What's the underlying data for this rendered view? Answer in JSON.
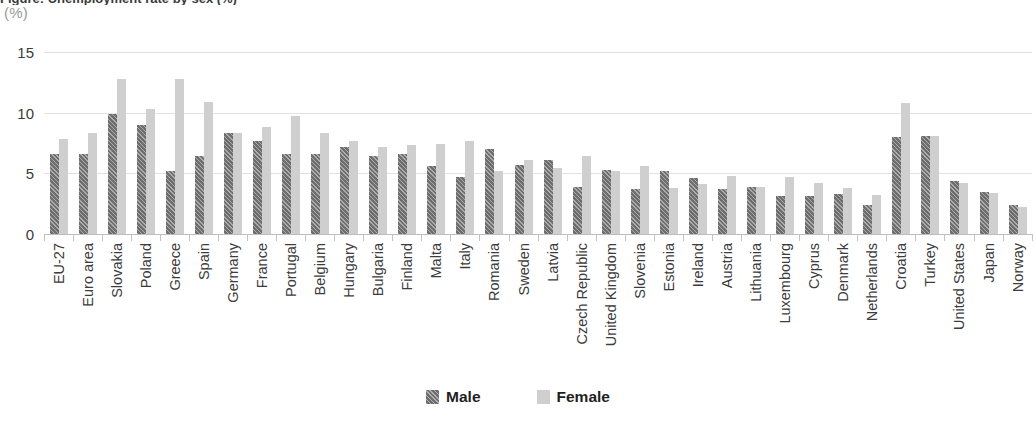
{
  "title": "Figure: Unemployment rate by sex (%)",
  "unit_label": "(%)",
  "legend": {
    "position": "bottom-center",
    "items": [
      {
        "label": "Male",
        "color": "#6e6e6e",
        "pattern": "diagonal-hatch"
      },
      {
        "label": "Female",
        "color": "#cfcfcf",
        "pattern": "solid"
      }
    ]
  },
  "yaxis": {
    "ticks": [
      "0",
      "5",
      "10",
      "15"
    ],
    "values": [
      0,
      5,
      10,
      15
    ],
    "min": 0,
    "max": 15
  },
  "chart_data": {
    "type": "bar",
    "title": "Figure: Unemployment rate by sex (%)",
    "xlabel": "",
    "ylabel": "(%)",
    "ylim": [
      0,
      15
    ],
    "yticks": [
      0,
      5,
      10,
      15
    ],
    "grid": "horizontal",
    "legend_position": "bottom-center",
    "categories": [
      "EU-27",
      "Euro area",
      "Slovakia",
      "Poland",
      "Greece",
      "Spain",
      "Germany",
      "France",
      "Portugal",
      "Belgium",
      "Hungary",
      "Bulgaria",
      "Finland",
      "Malta",
      "Italy",
      "Romania",
      "Sweden",
      "Latvia",
      "Czech Republic",
      "United Kingdom",
      "Slovenia",
      "Estonia",
      "Ireland",
      "Austria",
      "Lithuania",
      "Luxembourg",
      "Cyprus",
      "Denmark",
      "Netherlands",
      "Croatia",
      "Turkey",
      "United States",
      "Japan",
      "Norway"
    ],
    "series": [
      {
        "name": "Male",
        "color": "#6e6e6e",
        "values": [
          6.6,
          6.6,
          9.9,
          9.0,
          5.2,
          6.4,
          8.3,
          7.7,
          6.6,
          6.6,
          7.2,
          6.4,
          6.6,
          5.6,
          4.7,
          7.0,
          5.7,
          6.1,
          3.9,
          5.3,
          3.7,
          5.2,
          4.6,
          3.7,
          3.9,
          3.1,
          3.1,
          3.3,
          2.4,
          8.0,
          8.1,
          4.4,
          3.5,
          2.4
        ]
      },
      {
        "name": "Female",
        "color": "#cfcfcf",
        "values": [
          7.8,
          8.3,
          12.8,
          10.3,
          12.8,
          10.9,
          8.3,
          8.8,
          9.7,
          8.3,
          7.7,
          7.2,
          7.3,
          7.4,
          7.7,
          5.2,
          6.1,
          5.4,
          6.4,
          5.2,
          5.6,
          3.8,
          4.1,
          4.8,
          3.9,
          4.7,
          4.2,
          3.8,
          3.2,
          10.8,
          8.1,
          4.2,
          3.4,
          2.2
        ]
      }
    ]
  }
}
